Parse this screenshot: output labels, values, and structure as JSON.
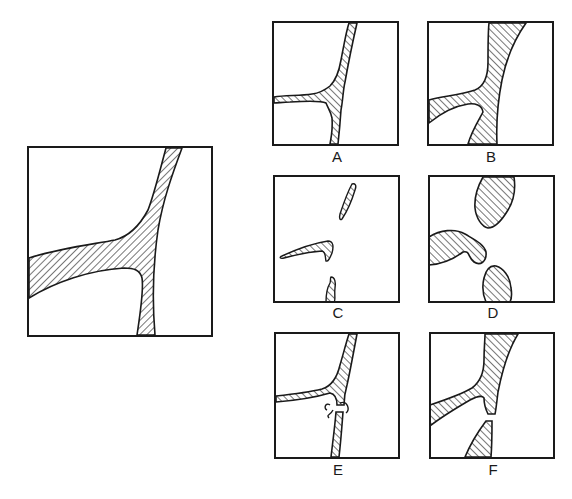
{
  "figure": {
    "reference_label": "",
    "options": [
      {
        "id": "A",
        "label": "A"
      },
      {
        "id": "B",
        "label": "B"
      },
      {
        "id": "C",
        "label": "C"
      },
      {
        "id": "D",
        "label": "D"
      },
      {
        "id": "E",
        "label": "E"
      },
      {
        "id": "F",
        "label": "F"
      }
    ],
    "colors": {
      "ink": "#1a1a1a",
      "paper": "#ffffff"
    }
  }
}
